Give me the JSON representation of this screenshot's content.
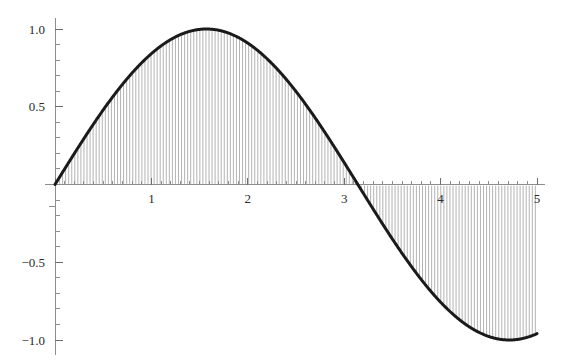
{
  "chart_data": {
    "type": "area",
    "title": "",
    "subtitle": "",
    "xlabel": "",
    "ylabel": "",
    "function": "sin(x)",
    "xlim": [
      0,
      5
    ],
    "ylim": [
      -1.0,
      1.0
    ],
    "grid": false,
    "legend": null,
    "fill_style": "vertical-hatching",
    "x_ticks_major": [
      1,
      2,
      3,
      4,
      5
    ],
    "x_tick_labels": [
      "1",
      "2",
      "3",
      "4",
      "5"
    ],
    "x_tick_minor_step": 0.1,
    "y_ticks_major": [
      1.0,
      0.5,
      -0.5,
      -1.0
    ],
    "y_tick_labels": [
      "1.0",
      "0.5",
      "-0.5",
      "-1.0"
    ],
    "y_tick_minor_step": 0.1,
    "x": [
      0.0,
      0.1,
      0.2,
      0.3,
      0.4,
      0.5,
      0.6,
      0.7,
      0.8,
      0.9,
      1.0,
      1.1,
      1.2,
      1.3,
      1.4,
      1.5,
      1.6,
      1.7,
      1.8,
      1.9,
      2.0,
      2.1,
      2.2,
      2.3,
      2.4,
      2.5,
      2.6,
      2.7,
      2.8,
      2.9,
      3.0,
      3.1,
      3.2,
      3.3,
      3.4,
      3.5,
      3.6,
      3.7,
      3.8,
      3.9,
      4.0,
      4.1,
      4.2,
      4.3,
      4.4,
      4.5,
      4.6,
      4.7,
      4.8,
      4.9,
      5.0
    ],
    "y": [
      0.0,
      0.0998,
      0.1987,
      0.2955,
      0.3894,
      0.4794,
      0.5646,
      0.6442,
      0.7174,
      0.7833,
      0.8415,
      0.8912,
      0.932,
      0.9636,
      0.9854,
      0.9975,
      0.9996,
      0.9917,
      0.9738,
      0.9463,
      0.9093,
      0.8632,
      0.8085,
      0.7457,
      0.6755,
      0.5985,
      0.5155,
      0.4274,
      0.335,
      0.2392,
      0.1411,
      0.0416,
      -0.0584,
      -0.1577,
      -0.2555,
      -0.3508,
      -0.4425,
      -0.5298,
      -0.6119,
      -0.6878,
      -0.7568,
      -0.8183,
      -0.8716,
      -0.9162,
      -0.9516,
      -0.9775,
      -0.9937,
      -0.9999,
      -0.9962,
      -0.9825,
      -0.9589
    ],
    "annotations": {
      "maximum": {
        "x": 1.5708,
        "y": 1.0
      },
      "zero_crossing": {
        "x": 3.1416,
        "y": 0.0
      },
      "minimum": {
        "x": 4.7124,
        "y": -1.0
      }
    },
    "colors": {
      "curve": "#1a1a1a",
      "hatch": "#9a9a9a",
      "axis": "#8d8d8d",
      "label": "#2b2b2b",
      "background": "#ffffff"
    }
  }
}
